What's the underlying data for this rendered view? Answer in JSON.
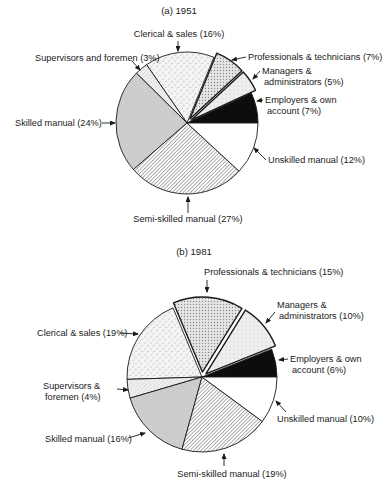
{
  "chart_data": [
    {
      "type": "pie",
      "title": "(a) 1951",
      "center": [
        187,
        123
      ],
      "radius": 71,
      "start_angle_deg": 0,
      "direction": "counter-clockwise",
      "slices": [
        {
          "label": "Employers & own account",
          "value": 7,
          "pattern": "black",
          "exploded": false,
          "text": [
            "Employers & own",
            "account (7%)"
          ],
          "text_pos": [
            265,
            103
          ],
          "anchor": "start",
          "arrow": [
            [
              263,
              100
            ],
            [
              257,
              101
            ]
          ]
        },
        {
          "label": "Managers & administrators",
          "value": 5,
          "pattern": "light-dots",
          "exploded": true,
          "text": [
            "Managers &",
            "administrators (5%)"
          ],
          "text_pos": [
            262,
            74
          ],
          "anchor": "start",
          "arrow": [
            [
              260,
              71
            ],
            [
              253,
              79
            ]
          ]
        },
        {
          "label": "Professionals & technicians",
          "value": 7,
          "pattern": "cross-dots",
          "exploded": true,
          "text": [
            "Professionals & technicians (7%)"
          ],
          "text_pos": [
            248,
            60
          ],
          "anchor": "start",
          "arrow": [
            [
              246,
              57
            ],
            [
              232,
              60
            ]
          ]
        },
        {
          "label": "Clerical & sales",
          "value": 16,
          "pattern": "sparse-dots",
          "exploded": false,
          "text": [
            "Clerical & sales (16%)"
          ],
          "text_pos": [
            179,
            37
          ],
          "anchor": "middle",
          "arrow": [
            [
              178,
              41
            ],
            [
              178,
              51
            ]
          ]
        },
        {
          "label": "Supervisors and foremen",
          "value": 3,
          "pattern": "light-lines",
          "exploded": false,
          "text": [
            "Supervisors and foremen (3%)"
          ],
          "text_pos": [
            35,
            61
          ],
          "anchor": "start",
          "arrow": [
            [
              132,
              61
            ],
            [
              140,
              70
            ]
          ]
        },
        {
          "label": "Skilled manual",
          "value": 24,
          "pattern": "fine-hatch",
          "exploded": false,
          "text": [
            "Skilled manual (24%)"
          ],
          "text_pos": [
            15,
            126
          ],
          "anchor": "start",
          "arrow": [
            [
              102,
              123
            ],
            [
              115,
              123
            ]
          ]
        },
        {
          "label": "Semi-skilled manual",
          "value": 27,
          "pattern": "diagonal",
          "exploded": false,
          "text": [
            "Semi-skilled manual (27%)"
          ],
          "text_pos": [
            188,
            222
          ],
          "anchor": "middle",
          "arrow": [
            [
              188,
              213
            ],
            [
              188,
              197
            ]
          ]
        },
        {
          "label": "Unskilled manual",
          "value": 12,
          "pattern": "white",
          "exploded": false,
          "text": [
            "Unskilled manual (12%)"
          ],
          "text_pos": [
            268,
            163
          ],
          "anchor": "start",
          "arrow": [
            [
              266,
              160
            ],
            [
              254,
              148
            ]
          ]
        }
      ]
    },
    {
      "type": "pie",
      "title": "(b) 1981",
      "center": [
        202,
        377
      ],
      "radius": 75,
      "start_angle_deg": 0,
      "direction": "counter-clockwise",
      "slices": [
        {
          "label": "Employers & own account",
          "value": 6,
          "pattern": "black",
          "exploded": false,
          "text": [
            "Employers & own",
            "account (6%)"
          ],
          "text_pos": [
            290,
            362
          ],
          "anchor": "start",
          "arrow": [
            [
              288,
              359
            ],
            [
              279,
              360
            ]
          ]
        },
        {
          "label": "Managers & administrators",
          "value": 10,
          "pattern": "light-dots",
          "exploded": true,
          "text": [
            "Managers &",
            "administrators (10%)"
          ],
          "text_pos": [
            277,
            308
          ],
          "anchor": "start",
          "arrow": [
            [
              275,
              312
            ],
            [
              266,
              323
            ]
          ]
        },
        {
          "label": "Professionals & technicians",
          "value": 15,
          "pattern": "cross-dots",
          "exploded": true,
          "text": [
            "Professionals & technicians (15%)"
          ],
          "text_pos": [
            204,
            275
          ],
          "anchor": "start",
          "arrow": [
            [
              207,
              280
            ],
            [
              207,
              292
            ]
          ]
        },
        {
          "label": "Clerical & sales",
          "value": 19,
          "pattern": "sparse-dots",
          "exploded": false,
          "text": [
            "Clerical & sales (19%)"
          ],
          "text_pos": [
            37,
            336
          ],
          "anchor": "start",
          "arrow": [
            [
              120,
              333
            ],
            [
              138,
              334
            ]
          ]
        },
        {
          "label": "Supervisors & foremen",
          "value": 4,
          "pattern": "light-lines",
          "exploded": false,
          "text": [
            "Supervisors &",
            "foremen (4%)"
          ],
          "text_pos": [
            43,
            389
          ],
          "anchor": "start",
          "arrow": [
            [
              117,
              389
            ],
            [
              128,
              390
            ]
          ]
        },
        {
          "label": "Skilled manual",
          "value": 16,
          "pattern": "fine-hatch",
          "exploded": false,
          "text": [
            "Skilled manual (16%)"
          ],
          "text_pos": [
            45,
            442
          ],
          "anchor": "start",
          "arrow": [
            [
              128,
              438
            ],
            [
              145,
              433
            ]
          ]
        },
        {
          "label": "Semi-skilled manual",
          "value": 19,
          "pattern": "diagonal",
          "exploded": false,
          "text": [
            "Semi-skilled manual (19%)"
          ],
          "text_pos": [
            232,
            477
          ],
          "anchor": "middle",
          "arrow": [
            [
              224,
              466
            ],
            [
              224,
              454
            ]
          ]
        },
        {
          "label": "Unskilled manual",
          "value": 10,
          "pattern": "white",
          "exploded": false,
          "text": [
            "Unskilled manual (10%)"
          ],
          "text_pos": [
            277,
            422
          ],
          "anchor": "start",
          "arrow": [
            [
              286,
              412
            ],
            [
              276,
              401
            ]
          ]
        }
      ]
    }
  ]
}
